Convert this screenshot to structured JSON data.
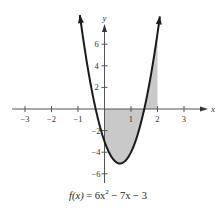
{
  "chart_data": {
    "type": "line",
    "function": {
      "a": 6,
      "b": -7,
      "c": -3
    },
    "xlabel": "x",
    "ylabel": "y",
    "x_ticks": [
      -3,
      -2,
      -1,
      1,
      2,
      3
    ],
    "x_tick_labels": [
      "−3",
      "−2",
      "−1",
      "1",
      "2",
      "3"
    ],
    "y_ticks": [
      6,
      4,
      2,
      -2,
      -4,
      -6
    ],
    "y_tick_labels": [
      "6",
      "4",
      "2",
      "−2",
      "−4",
      "−6"
    ],
    "xlim": [
      -3.6,
      3.8
    ],
    "ylim": [
      -6.8,
      8.6
    ],
    "grid": false,
    "shaded_region": {
      "x_from": 0,
      "x_to": 2,
      "between": "curve and x-axis"
    },
    "curve_x_range": [
      -0.93,
      2.09
    ],
    "roots": [
      -0.333,
      1.5
    ],
    "vertex": [
      0.583,
      -5.04
    ],
    "colors": {
      "curve": "#1a1a1a",
      "axis": "#555555",
      "shade": "#c9c9c9"
    }
  },
  "caption": {
    "prefix": "f(x)",
    "eq": " = 6x",
    "exp": "2",
    "rest": " − 7x − 3"
  }
}
